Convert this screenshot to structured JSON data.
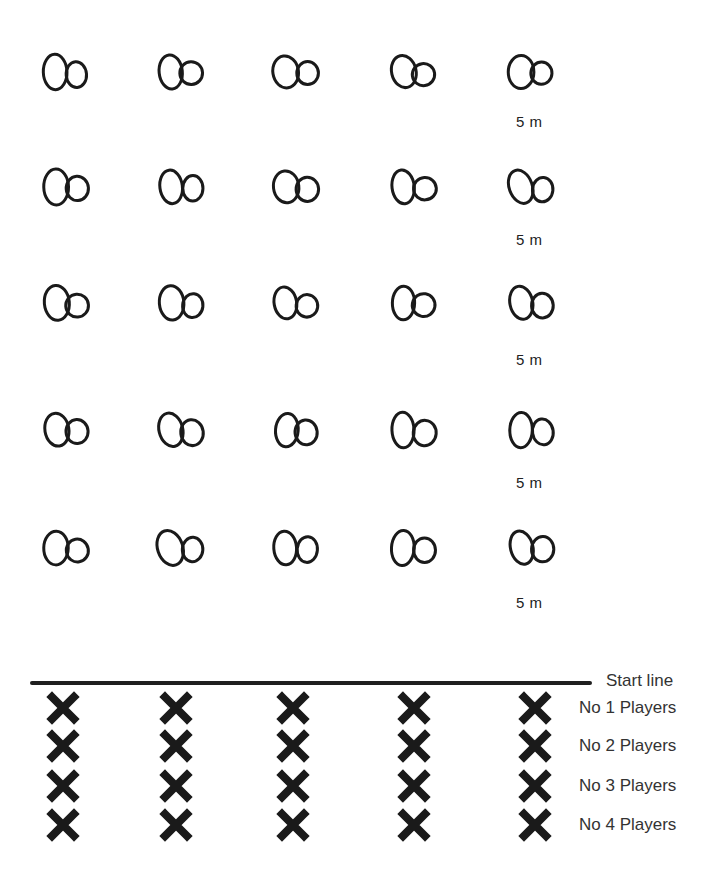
{
  "diagram": {
    "type": "drill-layout",
    "cone_grid": {
      "columns": 5,
      "rows": 5,
      "column_x": [
        65,
        180,
        295,
        412,
        530
      ],
      "row_y": [
        72,
        187,
        303,
        430,
        548
      ],
      "distance_labels": [
        "5 m",
        "5 m",
        "5 m",
        "5 m",
        "5 m"
      ],
      "distance_label_y": [
        122,
        240,
        360,
        483,
        603
      ]
    },
    "start_line": {
      "label": "Start line"
    },
    "player_rows": [
      {
        "label": "No 1 Players",
        "y": 708
      },
      {
        "label": "No 2 Players",
        "y": 746
      },
      {
        "label": "No 3 Players",
        "y": 786
      },
      {
        "label": "No 4 Players",
        "y": 825
      }
    ],
    "player_columns_x": [
      63,
      176,
      293,
      414,
      535
    ],
    "colors": {
      "ink": "#1a1a1a",
      "background": "#ffffff"
    }
  }
}
